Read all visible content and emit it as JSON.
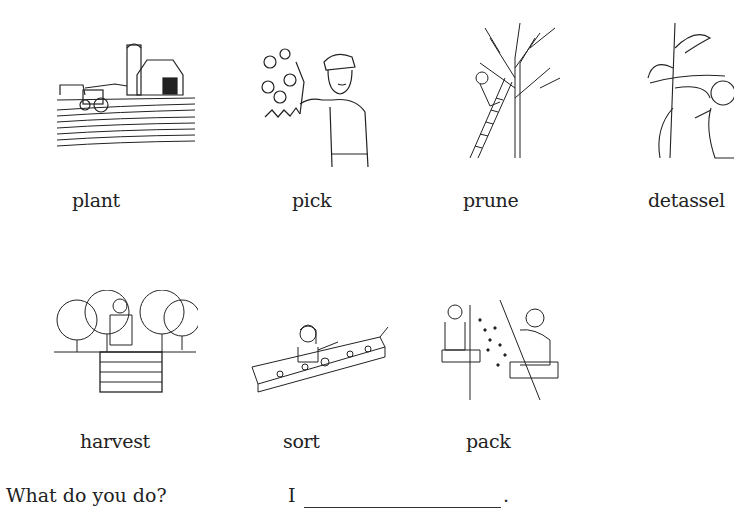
{
  "worksheet": {
    "row1": [
      {
        "label": "plant",
        "icon": "farm-field-tractor-illustration"
      },
      {
        "label": "pick",
        "icon": "man-picking-fruit-illustration"
      },
      {
        "label": "prune",
        "icon": "person-pruning-tree-on-ladder-illustration"
      },
      {
        "label": "detassel",
        "icon": "person-detasseling-corn-illustration"
      }
    ],
    "row2": [
      {
        "label": "harvest",
        "icon": "man-harvesting-orchard-bin-illustration"
      },
      {
        "label": "sort",
        "icon": "woman-sorting-conveyor-illustration"
      },
      {
        "label": "pack",
        "icon": "workers-packing-fruit-illustration"
      }
    ],
    "question": "What do you do?",
    "answer_prefix": "I",
    "answer_suffix": ".",
    "answer_value": ""
  }
}
